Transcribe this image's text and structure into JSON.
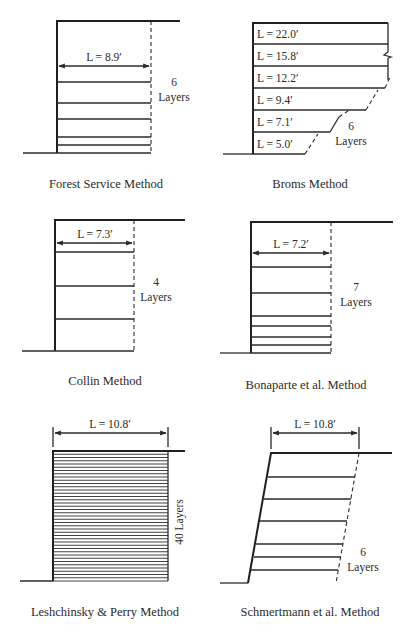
{
  "figure": {
    "panels": [
      {
        "id": "forest-service",
        "caption": "Forest Service Method",
        "length_label": "L = 8.9′",
        "layer_count": "6",
        "layer_word": "Layers"
      },
      {
        "id": "broms",
        "caption": "Broms Method",
        "layer_lengths": [
          "L = 22.0′",
          "L = 15.8′",
          "L = 12.2′",
          "L = 9.4′",
          "L = 7.1′",
          "L = 5.0′"
        ],
        "layer_count": "6",
        "layer_word": "Layers"
      },
      {
        "id": "collin",
        "caption": "Collin Method",
        "length_label": "L = 7.3′",
        "layer_count": "4",
        "layer_word": "Layers"
      },
      {
        "id": "bonaparte",
        "caption": "Bonaparte et al. Method",
        "length_label": "L = 7.2′",
        "layer_count": "7",
        "layer_word": "Layers"
      },
      {
        "id": "leshchinsky-perry",
        "caption": "Leshchinsky & Perry Method",
        "length_label": "L = 10.8′",
        "layer_label_vertical": "40 Layers"
      },
      {
        "id": "schmertmann",
        "caption": "Schmertmann et al. Method",
        "length_label": "L = 10.8′",
        "layer_count": "6",
        "layer_word": "Layers"
      }
    ]
  }
}
